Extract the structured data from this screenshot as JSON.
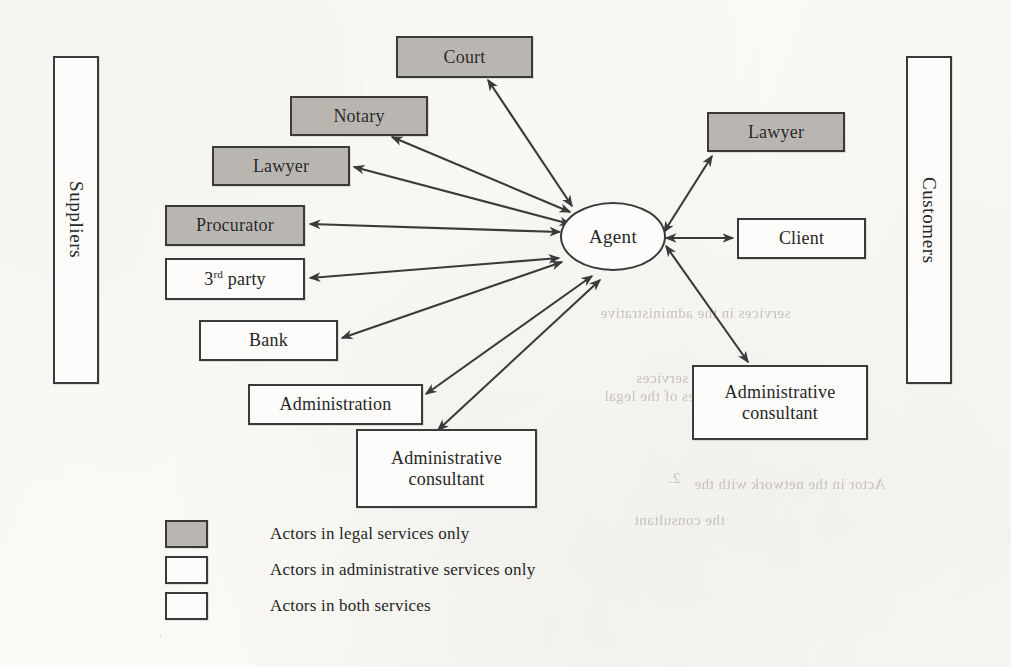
{
  "diagram": {
    "background_color": "#fbfaf7",
    "line_color": "#3a3a3a",
    "legal_fill": "#b9b6b1",
    "admin_fill": "#fdfcfa"
  },
  "boundaries": {
    "left": {
      "label": "Suppliers"
    },
    "right": {
      "label": "Customers"
    }
  },
  "center": {
    "label": "Agent",
    "shape": "ellipse"
  },
  "nodes": [
    {
      "id": "court",
      "label": "Court",
      "category": "legal",
      "side": "supplier"
    },
    {
      "id": "notary",
      "label": "Notary",
      "category": "legal",
      "side": "supplier"
    },
    {
      "id": "lawyer-left",
      "label": "Lawyer",
      "category": "legal",
      "side": "supplier"
    },
    {
      "id": "procurator",
      "label": "Procurator",
      "category": "legal",
      "side": "supplier"
    },
    {
      "id": "third-party",
      "label": "3rd party",
      "category": "both",
      "side": "supplier",
      "superscript": "rd",
      "base": "3",
      "tail": " party"
    },
    {
      "id": "bank",
      "label": "Bank",
      "category": "both",
      "side": "supplier"
    },
    {
      "id": "administration",
      "label": "Administration",
      "category": "admin",
      "side": "supplier"
    },
    {
      "id": "admin-consultant-left",
      "label": "Administrative consultant",
      "category": "admin",
      "side": "supplier"
    },
    {
      "id": "lawyer-right",
      "label": "Lawyer",
      "category": "legal",
      "side": "customer"
    },
    {
      "id": "client",
      "label": "Client",
      "category": "both",
      "side": "customer"
    },
    {
      "id": "admin-consultant-right",
      "label": "Administrative consultant",
      "category": "admin",
      "side": "customer"
    }
  ],
  "edges": [
    {
      "from": "agent",
      "to": "court",
      "type": "bidirectional"
    },
    {
      "from": "agent",
      "to": "notary",
      "type": "bidirectional"
    },
    {
      "from": "agent",
      "to": "lawyer-left",
      "type": "bidirectional"
    },
    {
      "from": "agent",
      "to": "procurator",
      "type": "bidirectional"
    },
    {
      "from": "agent",
      "to": "third-party",
      "type": "bidirectional"
    },
    {
      "from": "agent",
      "to": "bank",
      "type": "bidirectional"
    },
    {
      "from": "agent",
      "to": "administration",
      "type": "bidirectional"
    },
    {
      "from": "agent",
      "to": "admin-consultant-left",
      "type": "bidirectional"
    },
    {
      "from": "agent",
      "to": "lawyer-right",
      "type": "bidirectional"
    },
    {
      "from": "agent",
      "to": "client",
      "type": "bidirectional"
    },
    {
      "from": "agent",
      "to": "admin-consultant-right",
      "type": "bidirectional"
    }
  ],
  "legend": {
    "items": [
      {
        "swatch": "legal",
        "label": "Actors in legal services only"
      },
      {
        "swatch": "admin",
        "label": "Actors in administrative services only"
      },
      {
        "swatch": "both",
        "label": "Actors in both services"
      }
    ]
  },
  "ghost_text": [
    {
      "text": "services in the administrative",
      "x": 612,
      "y": 316
    },
    {
      "text": "services",
      "x": 648,
      "y": 380
    },
    {
      "text": "The services of the legal",
      "x": 614,
      "y": 398
    },
    {
      "text": "2.",
      "x": 676,
      "y": 480
    },
    {
      "text": "Actor in the network with the",
      "x": 700,
      "y": 486
    },
    {
      "text": "the consultant",
      "x": 640,
      "y": 520
    }
  ]
}
